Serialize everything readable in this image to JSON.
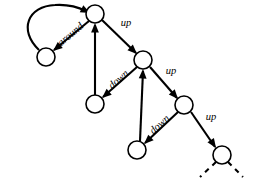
{
  "diagram": {
    "type": "directed-graph",
    "background": "#ffffff",
    "stroke_color": "#000000",
    "node_fill": "#ffffff",
    "node_radius": 9,
    "nodes": [
      {
        "id": "n0",
        "name": "node-top",
        "x": 95,
        "y": 14,
        "label": ""
      },
      {
        "id": "n1",
        "name": "node-left",
        "x": 46,
        "y": 57,
        "label": ""
      },
      {
        "id": "n2",
        "name": "node-mid-upper",
        "x": 143,
        "y": 60,
        "label": ""
      },
      {
        "id": "n3",
        "name": "node-mid-left",
        "x": 95,
        "y": 104,
        "label": ""
      },
      {
        "id": "n4",
        "name": "node-mid-right",
        "x": 184,
        "y": 105,
        "label": ""
      },
      {
        "id": "n5",
        "name": "node-lower-mid",
        "x": 137,
        "y": 150,
        "label": ""
      },
      {
        "id": "n6",
        "name": "node-bottom-right",
        "x": 222,
        "y": 155,
        "label": ""
      }
    ],
    "edges": [
      {
        "id": "e-around-back",
        "name": "edge-around-return",
        "from": "n1",
        "to": "n0",
        "style": "curved",
        "label": "",
        "path": "M 39 50 C 18 30 28 6 55 5 C 70 4 80 8 86 11",
        "arrow": {
          "x": 90,
          "y": 13,
          "angle": 27
        }
      },
      {
        "id": "e-around",
        "name": "edge-around",
        "from": "n0",
        "to": "n1",
        "style": "straight",
        "label": "around",
        "x1": 89,
        "y1": 21,
        "x2": 54,
        "y2": 50,
        "arrow": {
          "x": 53,
          "y": 51,
          "angle": 140
        },
        "label_x": 71,
        "label_y": 35,
        "label_rotate": -40
      },
      {
        "id": "e-up-1",
        "name": "edge-up-top-to-mid",
        "from": "n0",
        "to": "n2",
        "style": "straight",
        "label": "up",
        "x1": 102,
        "y1": 20,
        "x2": 136,
        "y2": 53,
        "arrow": {
          "x": 137,
          "y": 54,
          "angle": 44
        },
        "label_x": 126,
        "label_y": 24,
        "label_rotate": 0
      },
      {
        "id": "e-up-2",
        "name": "edge-up-midleft-to-top",
        "from": "n3",
        "to": "n0",
        "style": "straight",
        "label": "",
        "x1": 95,
        "y1": 95,
        "x2": 95,
        "y2": 25,
        "arrow": {
          "x": 95,
          "y": 23,
          "angle": -90
        }
      },
      {
        "id": "e-down-1",
        "name": "edge-down-mid-to-midleft",
        "from": "n2",
        "to": "n3",
        "style": "straight",
        "label": "down",
        "x1": 137,
        "y1": 67,
        "x2": 103,
        "y2": 97,
        "arrow": {
          "x": 102,
          "y": 98,
          "angle": 139
        },
        "label_x": 119,
        "label_y": 80,
        "label_rotate": -41
      },
      {
        "id": "e-up-3",
        "name": "edge-up-mid-to-midright",
        "from": "n2",
        "to": "n4",
        "style": "straight",
        "label": "up",
        "x1": 150,
        "y1": 67,
        "x2": 177,
        "y2": 98,
        "arrow": {
          "x": 178,
          "y": 99,
          "angle": 49
        },
        "label_x": 171,
        "label_y": 72,
        "label_rotate": 0
      },
      {
        "id": "e-up-4",
        "name": "edge-up-lowermid-to-mid",
        "from": "n5",
        "to": "n2",
        "style": "straight",
        "label": "",
        "x1": 140,
        "y1": 141,
        "x2": 143,
        "y2": 71,
        "arrow": {
          "x": 143,
          "y": 69,
          "angle": -88
        }
      },
      {
        "id": "e-down-2",
        "name": "edge-down-midright-to-lowermid",
        "from": "n4",
        "to": "n5",
        "style": "straight",
        "label": "down",
        "x1": 178,
        "y1": 112,
        "x2": 145,
        "y2": 143,
        "arrow": {
          "x": 144,
          "y": 144,
          "angle": 137
        },
        "label_x": 160,
        "label_y": 125,
        "label_rotate": -42
      },
      {
        "id": "e-up-5",
        "name": "edge-up-midright-to-bottomright",
        "from": "n4",
        "to": "n6",
        "style": "straight",
        "label": "up",
        "x1": 191,
        "y1": 112,
        "x2": 215,
        "y2": 147,
        "arrow": {
          "x": 216,
          "y": 148,
          "angle": 56
        },
        "label_x": 211,
        "label_y": 118,
        "label_rotate": 0
      },
      {
        "id": "e-stub-left",
        "name": "edge-dashed-stub-left",
        "from": "n6",
        "to": null,
        "style": "dashed",
        "label": "",
        "x1": 216,
        "y1": 162,
        "x2": 200,
        "y2": 177,
        "arrow": null
      },
      {
        "id": "e-stub-right",
        "name": "edge-dashed-stub-right",
        "from": "n6",
        "to": null,
        "style": "dashed",
        "label": "",
        "x1": 228,
        "y1": 162,
        "x2": 243,
        "y2": 177,
        "arrow": null
      }
    ],
    "labels": [
      "around",
      "up",
      "down",
      "up",
      "down",
      "up"
    ]
  }
}
